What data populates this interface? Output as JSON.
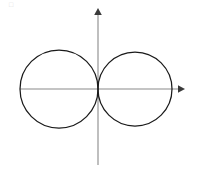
{
  "figure": {
    "background_color": "#ffffff",
    "width": 197,
    "height": 171,
    "corner_artifact_text": "□"
  },
  "axes": {
    "stroke_color": "#8a8a8a",
    "arrow_color": "#3a3a3a",
    "origin": {
      "x": 98,
      "y": 89
    },
    "x_axis": {
      "name": "x-axis",
      "start_x": 20,
      "end_x": 185,
      "y": 89,
      "arrow_direction": "right",
      "label": ""
    },
    "y_axis": {
      "name": "y-axis",
      "start_y": 165,
      "end_y": 8,
      "x": 98,
      "arrow_direction": "up",
      "label": ""
    }
  },
  "chart_data": {
    "type": "scatter",
    "xlabel": "x",
    "ylabel": "y",
    "grid": false,
    "legend_position": "none",
    "origin_px": {
      "x": 98,
      "y": 89
    },
    "shapes": [
      {
        "name": "left-circle",
        "type": "circle",
        "center_px": {
          "x": 59,
          "y": 89
        },
        "radius_px": 39,
        "stroke": "#1a1a1a",
        "fill": "none",
        "note": "passes through the origin; leftmost point on the x-axis"
      },
      {
        "name": "right-circle",
        "type": "circle",
        "center_px": {
          "x": 135,
          "y": 89
        },
        "radius_px": 37,
        "stroke": "#1a1a1a",
        "fill": "none",
        "note": "leftmost point near the origin; rightmost point on the x-axis"
      }
    ],
    "intersections_px": [
      {
        "name": "upper-intersection",
        "x": 98,
        "y": 62
      },
      {
        "name": "lower-intersection",
        "x": 98,
        "y": 116
      }
    ],
    "annotations": []
  }
}
